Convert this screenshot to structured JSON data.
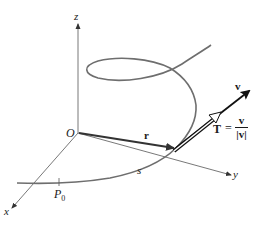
{
  "figure": {
    "type": "space-curve-diagram",
    "labels": {
      "z_axis": "z",
      "x_axis": "x",
      "y_axis": "y",
      "origin": "O",
      "position_vector": "r",
      "velocity_vector": "v",
      "arc_length": "s",
      "base_point": "P",
      "base_point_subscript": "0",
      "tangent_lhs": "T",
      "equals": "=",
      "tangent_numerator": "v",
      "tangent_denominator": "|v|"
    },
    "colors": {
      "axes": "#555555",
      "curve": "#6e6e6e",
      "vectors": "#222222",
      "text": "#1a1a1a",
      "background": "#ffffff"
    }
  }
}
